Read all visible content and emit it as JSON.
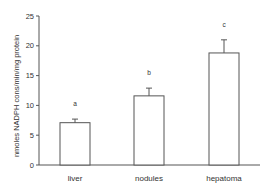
{
  "chart_data": {
    "type": "bar",
    "title": "",
    "xlabel": "",
    "ylabel": "nmoles NADPH cons/min/mg protein",
    "categories": [
      "liver",
      "nodules",
      "hepatoma"
    ],
    "values": [
      7.1,
      11.6,
      18.8
    ],
    "error_upper": [
      7.7,
      12.9,
      21.0
    ],
    "significance_letters": [
      "a",
      "b",
      "c"
    ],
    "ylim": [
      0,
      25
    ],
    "yticks": [
      0,
      5,
      10,
      15,
      20,
      25
    ],
    "grid": false,
    "legend": null
  },
  "colors": {
    "axis": "#555555",
    "bar_fill": "#ffffff",
    "bar_stroke": "#555555",
    "text": "#333333"
  }
}
